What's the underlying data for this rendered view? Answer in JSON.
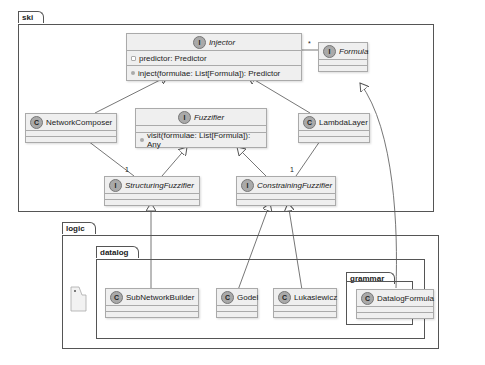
{
  "packages": {
    "ski": "ski",
    "logic": "logic",
    "datalog": "datalog",
    "grammar": "grammar"
  },
  "classes": {
    "injector": {
      "stereotype": "I",
      "name": "Injector",
      "field": "predictor: Predictor",
      "method": "inject(formulae: List[Formula]): Predictor"
    },
    "formula": {
      "stereotype": "I",
      "name": "Formula"
    },
    "fuzzifier": {
      "stereotype": "I",
      "name": "Fuzzifier",
      "method": "visit(formulae: List[Formula]): Any"
    },
    "network_composer": {
      "stereotype": "C",
      "name": "NetworkComposer"
    },
    "lambda_layer": {
      "stereotype": "C",
      "name": "LambdaLayer"
    },
    "structuring_fuzzifier": {
      "stereotype": "I",
      "name": "StructuringFuzzifier"
    },
    "constraining_fuzzifier": {
      "stereotype": "I",
      "name": "ConstrainingFuzzifier"
    },
    "sub_network_builder": {
      "stereotype": "C",
      "name": "SubNetworkBuilder"
    },
    "godel": {
      "stereotype": "C",
      "name": "Godel"
    },
    "lukasiewicz": {
      "stereotype": "C",
      "name": "Lukasiewicz"
    },
    "datalog_formula": {
      "stereotype": "C",
      "name": "DatalogFormula"
    }
  },
  "multiplicities": {
    "injector_formula": "*",
    "network_composer_structuring": "1",
    "lambda_layer_constraining": "1"
  },
  "relations": [
    {
      "from": "NetworkComposer",
      "to": "Injector",
      "type": "realization"
    },
    {
      "from": "LambdaLayer",
      "to": "Injector",
      "type": "realization"
    },
    {
      "from": "Injector",
      "to": "Formula",
      "type": "association"
    },
    {
      "from": "StructuringFuzzifier",
      "to": "Fuzzifier",
      "type": "generalization"
    },
    {
      "from": "ConstrainingFuzzifier",
      "to": "Fuzzifier",
      "type": "generalization"
    },
    {
      "from": "NetworkComposer",
      "to": "StructuringFuzzifier",
      "type": "composition"
    },
    {
      "from": "LambdaLayer",
      "to": "ConstrainingFuzzifier",
      "type": "composition"
    },
    {
      "from": "SubNetworkBuilder",
      "to": "StructuringFuzzifier",
      "type": "realization"
    },
    {
      "from": "Godel",
      "to": "ConstrainingFuzzifier",
      "type": "realization"
    },
    {
      "from": "Lukasiewicz",
      "to": "ConstrainingFuzzifier",
      "type": "realization"
    },
    {
      "from": "DatalogFormula",
      "to": "Formula",
      "type": "realization"
    }
  ]
}
